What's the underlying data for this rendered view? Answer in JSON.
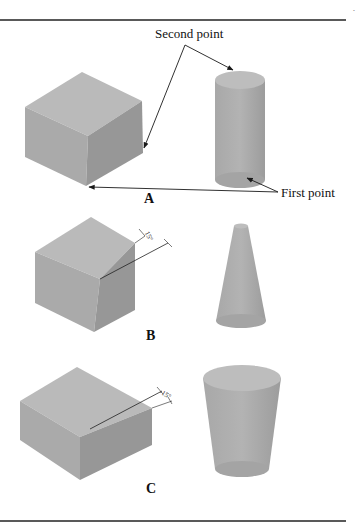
{
  "figure": {
    "callouts": {
      "second_point": "Second point",
      "first_point": "First point"
    },
    "panels": [
      {
        "id": "A",
        "caption": "A",
        "left_shape": "box",
        "right_shape": "cylinder",
        "angle_label": ""
      },
      {
        "id": "B",
        "caption": "B",
        "left_shape": "box with angled face",
        "right_shape": "cone",
        "angle_label": "15°"
      },
      {
        "id": "C",
        "caption": "C",
        "left_shape": "box with angled face",
        "right_shape": "inverted frustum",
        "angle_label": "-15°"
      }
    ],
    "colors": {
      "face_top": "#b9b9b9",
      "face_left": "#a9a9a9",
      "face_right": "#989898",
      "solid_body": "#adadad",
      "solid_top": "#bdbdbd",
      "rule": "#222222",
      "leader": "#1a1a1a"
    }
  }
}
